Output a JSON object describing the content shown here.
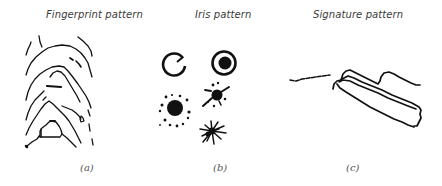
{
  "figure": {
    "panels": [
      {
        "id": "a",
        "title": "Fingerprint pattern",
        "caption": "(a)",
        "image": "fingerprint-ridges"
      },
      {
        "id": "b",
        "title": "Iris pattern",
        "caption": "(b)",
        "image": "iris-blobs"
      },
      {
        "id": "c",
        "title": "Signature pattern",
        "caption": "(c)",
        "image": "signature-stroke"
      }
    ],
    "colors": {
      "ink": "#111111",
      "title_text": "#3a3a3a",
      "caption_text": "#555555",
      "background": "#ffffff"
    }
  }
}
